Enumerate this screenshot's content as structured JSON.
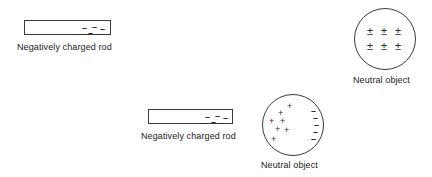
{
  "diagram": {
    "stroke_color": "#3a3a3a",
    "text_color": "#1a1a1a",
    "background_color": "#ffffff"
  },
  "panels": [
    {
      "id": "top",
      "rod": {
        "label": "Negatively charged rod",
        "charge_symbol": "–",
        "charge_count": 6,
        "charges": [
          {
            "sym": "–",
            "x": 6,
            "y": 3
          },
          {
            "sym": "–",
            "x": 16,
            "y": 2
          },
          {
            "sym": "–",
            "x": 24,
            "y": 4
          },
          {
            "sym": "–",
            "x": 2,
            "y": 9
          },
          {
            "sym": "–",
            "x": 12,
            "y": 8
          },
          {
            "sym": "–",
            "x": 21,
            "y": 9
          }
        ]
      },
      "object": {
        "label": "Neutral object",
        "charge_symbol": "±",
        "charge_count": 6,
        "charges": [
          {
            "sym": "±",
            "x": 12,
            "y": 17
          },
          {
            "sym": "±",
            "x": 26,
            "y": 17
          },
          {
            "sym": "±",
            "x": 40,
            "y": 17
          },
          {
            "sym": "±",
            "x": 12,
            "y": 32
          },
          {
            "sym": "±",
            "x": 26,
            "y": 32
          },
          {
            "sym": "±",
            "x": 40,
            "y": 32
          }
        ]
      }
    },
    {
      "id": "bottom",
      "rod": {
        "label": "Negatively charged rod",
        "charge_symbol": "–",
        "charge_count": 6,
        "charges": [
          {
            "sym": "–",
            "x": 7,
            "y": 3
          },
          {
            "sym": "–",
            "x": 17,
            "y": 2
          },
          {
            "sym": "–",
            "x": 25,
            "y": 4
          },
          {
            "sym": "–",
            "x": 3,
            "y": 9
          },
          {
            "sym": "–",
            "x": 13,
            "y": 8
          },
          {
            "sym": "–",
            "x": 22,
            "y": 9
          }
        ]
      },
      "object": {
        "label": "Neutral object",
        "polarized": true,
        "positive_symbol": "+",
        "negative_symbol": "–",
        "positive_count": 7,
        "negative_count": 6,
        "charges": [
          {
            "sym": "+",
            "x": 24,
            "y": 7
          },
          {
            "sym": "+",
            "x": 15,
            "y": 14
          },
          {
            "sym": "+",
            "x": 6,
            "y": 22
          },
          {
            "sym": "+",
            "x": 17,
            "y": 22
          },
          {
            "sym": "+",
            "x": 12,
            "y": 30
          },
          {
            "sym": "+",
            "x": 21,
            "y": 31
          },
          {
            "sym": "+",
            "x": 8,
            "y": 40
          },
          {
            "sym": "–",
            "x": 48,
            "y": 12
          },
          {
            "sym": "–",
            "x": 50,
            "y": 19
          },
          {
            "sym": "–",
            "x": 51,
            "y": 26
          },
          {
            "sym": "–",
            "x": 50,
            "y": 33
          },
          {
            "sym": "–",
            "x": 48,
            "y": 40
          }
        ]
      }
    }
  ]
}
